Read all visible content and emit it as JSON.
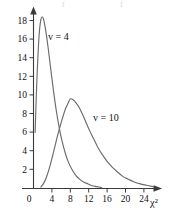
{
  "chart_data": {
    "type": "line",
    "title": "",
    "subtitle": "",
    "xlabel": "χ²",
    "ylabel": "",
    "xlim": [
      0,
      27
    ],
    "ylim": [
      0,
      19.5
    ],
    "xticks": [
      0,
      4,
      8,
      12,
      16,
      20,
      24
    ],
    "yticks": [
      2,
      4,
      6,
      8,
      10,
      12,
      14,
      16,
      18
    ],
    "xtick_labels": [
      "0",
      "4",
      "8",
      "12",
      "16",
      "20",
      "24"
    ],
    "ytick_labels": [
      "2",
      "4",
      "6",
      "8",
      "10",
      "12",
      "14",
      "16",
      "18"
    ],
    "grid": false,
    "legend_position": "inline-annotation",
    "annotations": [
      {
        "text": "v = 4",
        "x": 5.2,
        "y": 17.0
      },
      {
        "text": "v = 10",
        "x": 13.2,
        "y": 8.0
      }
    ],
    "series": [
      {
        "name": "v = 4",
        "label": "v = 4",
        "peak_x": 1.9,
        "peak_y": 18.4,
        "color": "#6b6b6b",
        "x": [
          0.35,
          0.6,
          0.85,
          1.1,
          1.35,
          1.6,
          1.9,
          2.2,
          2.5,
          2.85,
          3.2,
          3.6,
          4.0,
          4.5,
          5.0,
          5.6,
          6.2,
          6.9,
          7.6,
          8.4,
          9.2,
          10.0,
          10.9,
          11.8,
          12.8,
          13.8,
          14.8
        ],
        "y": [
          6.0,
          9.8,
          13.0,
          15.5,
          17.2,
          18.1,
          18.4,
          18.1,
          17.4,
          16.3,
          15.0,
          13.4,
          11.8,
          9.9,
          8.2,
          6.5,
          5.1,
          3.8,
          2.8,
          2.0,
          1.4,
          1.0,
          0.7,
          0.5,
          0.3,
          0.2,
          0.1
        ]
      },
      {
        "name": "v = 10",
        "label": "v = 10",
        "peak_x": 8.0,
        "peak_y": 9.6,
        "color": "#6b6b6b",
        "x": [
          1.6,
          2.2,
          2.8,
          3.4,
          4.0,
          4.6,
          5.2,
          5.8,
          6.4,
          7.0,
          7.5,
          8.0,
          8.6,
          9.2,
          9.9,
          10.6,
          11.4,
          12.2,
          13.1,
          14.0,
          15.0,
          16.0,
          17.1,
          18.2,
          19.4,
          20.6,
          21.9,
          23.2,
          24.6,
          26.0
        ],
        "y": [
          0.15,
          0.55,
          1.2,
          2.1,
          3.2,
          4.4,
          5.6,
          6.7,
          7.7,
          8.6,
          9.1,
          9.6,
          9.5,
          9.2,
          8.7,
          8.0,
          7.1,
          6.2,
          5.3,
          4.4,
          3.6,
          2.9,
          2.3,
          1.8,
          1.3,
          1.0,
          0.7,
          0.5,
          0.35,
          0.2
        ]
      }
    ]
  },
  "axes": {
    "x_axis_name": "chi-squared",
    "y_axis_name": "density"
  },
  "colors": {
    "curve": "#6b6b6b",
    "axis": "#3a3a3a",
    "text": "#111111",
    "background": "#ffffff"
  }
}
